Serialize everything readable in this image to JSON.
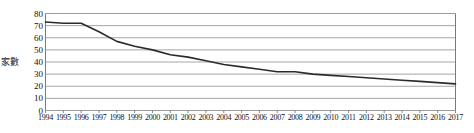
{
  "chart_data": {
    "type": "line",
    "title": "",
    "xlabel": "",
    "ylabel": "家數",
    "ylim": [
      0,
      80
    ],
    "yticks": [
      0,
      10,
      20,
      30,
      40,
      50,
      60,
      70,
      80
    ],
    "grid": true,
    "legend": "none",
    "line_color": "#2b2b2b",
    "grid_color": "#9b9b9b",
    "axis_color": "#7a7a7a",
    "categories": [
      "1994",
      "1995",
      "1996",
      "1997",
      "1998",
      "1999",
      "2000",
      "2001",
      "2002",
      "2003",
      "2004",
      "2005",
      "2006",
      "2007",
      "2008",
      "2009",
      "2010",
      "2011",
      "2012",
      "2013",
      "2014",
      "2015",
      "2016",
      "2017"
    ],
    "values": [
      73,
      72,
      72,
      65,
      57,
      53,
      50,
      46,
      44,
      41,
      38,
      36,
      34,
      32,
      32,
      30,
      29,
      28,
      27,
      26,
      25,
      24,
      23,
      22
    ],
    "series": [
      {
        "name": "家數",
        "values": [
          73,
          72,
          72,
          65,
          57,
          53,
          50,
          46,
          44,
          41,
          38,
          36,
          34,
          32,
          32,
          30,
          29,
          28,
          27,
          26,
          25,
          24,
          23,
          22
        ]
      }
    ]
  }
}
